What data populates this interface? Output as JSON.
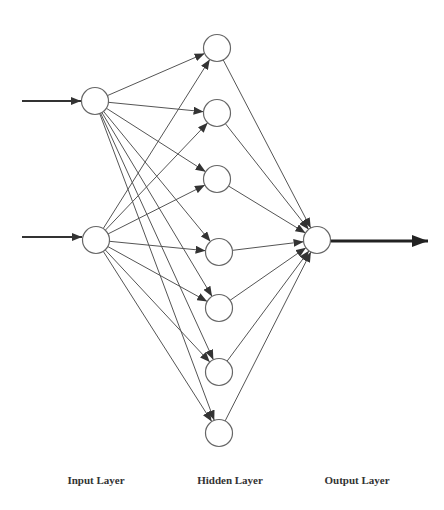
{
  "diagram": {
    "type": "feedforward-neural-network",
    "colors": {
      "line": "#555555",
      "node_stroke": "#666666",
      "node_fill": "#ffffff",
      "arrow": "#333333"
    },
    "layers": [
      {
        "id": "input",
        "label": "Input Layer",
        "label_x": 96,
        "nodes": [
          {
            "x": 95,
            "y": 101
          },
          {
            "x": 96,
            "y": 240
          }
        ]
      },
      {
        "id": "hidden",
        "label": "Hidden Layer",
        "label_x": 230,
        "nodes": [
          {
            "x": 217,
            "y": 48
          },
          {
            "x": 217,
            "y": 113
          },
          {
            "x": 217,
            "y": 179
          },
          {
            "x": 219,
            "y": 252
          },
          {
            "x": 219,
            "y": 308
          },
          {
            "x": 219,
            "y": 372
          },
          {
            "x": 219,
            "y": 433
          }
        ]
      },
      {
        "id": "output",
        "label": "Output Layer",
        "label_x": 357,
        "nodes": [
          {
            "x": 317,
            "y": 240
          }
        ]
      }
    ],
    "node_radius": 13.5,
    "input_arrows": [
      {
        "x1": 22,
        "y1": 101,
        "x2": 81
      },
      {
        "x1": 22,
        "y1": 237,
        "x2": 82
      }
    ],
    "output_arrow": {
      "x1": 331,
      "y1": 241,
      "x2": 428
    },
    "label_y": 474,
    "connectivity": "fully-connected"
  }
}
